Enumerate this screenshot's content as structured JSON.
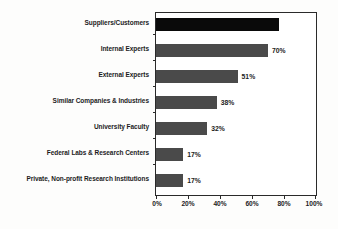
{
  "chart_data": {
    "type": "bar",
    "orientation": "horizontal",
    "title": "",
    "subtitle": "",
    "xlabel": "",
    "ylabel": "",
    "xlim": [
      0,
      100
    ],
    "grid": false,
    "legend": null,
    "legend_position": "none",
    "xtick_labels": [
      "0%",
      "20%",
      "40%",
      "60%",
      "80%",
      "100%"
    ],
    "xtick_values": [
      0,
      20,
      40,
      60,
      80,
      100
    ],
    "categories": [
      "Suppliers/Customers",
      "Internal Experts",
      "External Experts",
      "Similar Companies & Industries",
      "University Faculty",
      "Federal Labs & Research Centers",
      "Private, Non-profit Research Institutions"
    ],
    "values": [
      77,
      70,
      51,
      38,
      32,
      17,
      17
    ],
    "data_labels": [
      "",
      "70%",
      "51%",
      "38%",
      "32%",
      "17%",
      "17%"
    ],
    "bar_colors": [
      "#0a0a0a",
      "#4a4a4a",
      "#4a4a4a",
      "#4a4a4a",
      "#4a4a4a",
      "#4a4a4a",
      "#4a4a4a"
    ],
    "colors": {
      "highlight_bar": "#0a0a0a",
      "standard_bar": "#4a4a4a",
      "axis": "#2a2a2a",
      "text": "#1c1c1c",
      "plot_background": "#ffffff",
      "page_background": "#fdfdfc"
    }
  }
}
